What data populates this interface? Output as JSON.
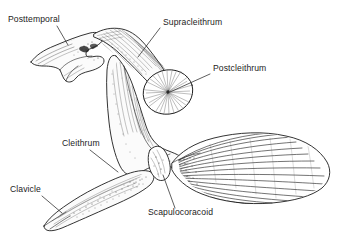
{
  "figure": {
    "style": "pen-and-ink line drawing with stipple and hatching",
    "background_color": "#ffffff",
    "line_color": "#1d1d1d",
    "label_color": "#232323",
    "width": 337,
    "height": 239
  },
  "labels": [
    {
      "id": "posttemporal",
      "text": "Posttemporal",
      "text_x": 8,
      "text_y": 22,
      "leader": {
        "x1": 57,
        "y1": 26,
        "x2": 68,
        "y2": 45
      },
      "anchor": "start"
    },
    {
      "id": "supracleithrum",
      "text": "Supracleithrum",
      "text_x": 163,
      "text_y": 25,
      "leader": {
        "x1": 160,
        "y1": 28,
        "x2": 138,
        "y2": 57
      },
      "anchor": "start"
    },
    {
      "id": "postcleithrum",
      "text": "Postcleithrum",
      "text_x": 213,
      "text_y": 71,
      "leader": {
        "x1": 210,
        "y1": 74,
        "x2": 170,
        "y2": 92
      },
      "anchor": "start"
    },
    {
      "id": "cleithrum",
      "text": "Cleithrum",
      "text_x": 62,
      "text_y": 146,
      "leader": {
        "x1": 90,
        "y1": 150,
        "x2": 118,
        "y2": 172
      },
      "anchor": "start"
    },
    {
      "id": "clavicle",
      "text": "Clavicle",
      "text_x": 10,
      "text_y": 192,
      "leader": {
        "x1": 42,
        "y1": 196,
        "x2": 62,
        "y2": 213
      },
      "anchor": "start"
    },
    {
      "id": "scapulocoracoid",
      "text": "Scapulocoracoid",
      "text_x": 148,
      "text_y": 215,
      "leader": {
        "x1": 175,
        "y1": 208,
        "x2": 163,
        "y2": 175
      },
      "anchor": "start"
    }
  ],
  "structures": [
    {
      "id": "posttemporal-bone",
      "name": "Posttemporal",
      "description": "forked Y-shaped bone at upper left with two tapering prongs"
    },
    {
      "id": "supracleithrum-bone",
      "name": "Supracleithrum",
      "description": "elongate diagonal bone running down-right from the posttemporal"
    },
    {
      "id": "postcleithrum-bone",
      "name": "Postcleithrum",
      "description": "oval disc with radiating striations, mid-right"
    },
    {
      "id": "cleithrum-bone",
      "name": "Cleithrum",
      "description": "large curved boomerang-shaped central element"
    },
    {
      "id": "clavicle-bone",
      "name": "Clavicle",
      "description": "long tapered spindle extending to lower left"
    },
    {
      "id": "scapulocoracoid-bone",
      "name": "Scapulocoracoid",
      "description": "small dark block at the base of the pectoral fin"
    },
    {
      "id": "pectoral-fin",
      "name": "Pectoral fin",
      "description": "large leaf-shaped fin at right with many parallel fin rays"
    }
  ]
}
